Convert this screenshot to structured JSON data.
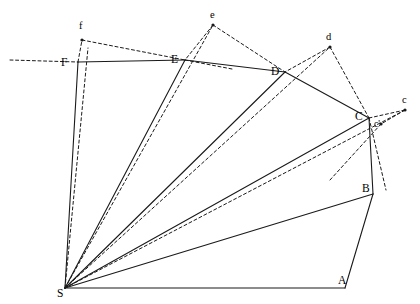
{
  "figure": {
    "width": 420,
    "height": 304,
    "background_color": "#ffffff",
    "stroke_color": "#1a1a1a",
    "solid_stroke_width": 1.1,
    "dashed_stroke_width": 1.0,
    "dash_pattern": "3,2.6",
    "dot_radius": 1.6
  },
  "points": {
    "S": {
      "x": 65,
      "y": 288,
      "label": "S",
      "label_x": 57,
      "label_y": 288,
      "kind": "apex"
    },
    "A": {
      "x": 345,
      "y": 288,
      "label": "A",
      "label_x": 338,
      "label_y": 275,
      "kind": "polygon"
    },
    "B": {
      "x": 373,
      "y": 194,
      "label": "B",
      "label_x": 362,
      "label_y": 183,
      "kind": "polygon"
    },
    "C": {
      "x": 369,
      "y": 118,
      "label": "C",
      "label_x": 355,
      "label_y": 111,
      "kind": "polygon"
    },
    "D": {
      "x": 285,
      "y": 72,
      "label": "D",
      "label_x": 271,
      "label_y": 66,
      "kind": "polygon"
    },
    "E": {
      "x": 185,
      "y": 60,
      "label": "E",
      "label_x": 171,
      "label_y": 54,
      "kind": "polygon"
    },
    "F": {
      "x": 78,
      "y": 62,
      "label": "F",
      "label_x": 61,
      "label_y": 57,
      "kind": "polygon"
    },
    "c": {
      "x": 405,
      "y": 110,
      "label": "c",
      "label_x": 402,
      "label_y": 95,
      "kind": "image"
    },
    "cp": {
      "x": 381,
      "y": 124,
      "label": "c'",
      "label_x": 374,
      "label_y": 120,
      "kind": "image"
    },
    "d": {
      "x": 330,
      "y": 47,
      "label": "d",
      "label_x": 326,
      "label_y": 32,
      "kind": "image"
    },
    "e": {
      "x": 213,
      "y": 25,
      "label": "e",
      "label_x": 210,
      "label_y": 10,
      "kind": "image"
    },
    "f": {
      "x": 82,
      "y": 40,
      "label": "f",
      "label_x": 79,
      "label_y": 21,
      "kind": "image"
    }
  },
  "solid_edges": [
    {
      "name": "edge-S-A",
      "from": "S",
      "to": "A"
    },
    {
      "name": "edge-A-B",
      "from": "A",
      "to": "B"
    },
    {
      "name": "edge-B-C",
      "from": "B",
      "to": "C"
    },
    {
      "name": "edge-C-D",
      "from": "C",
      "to": "D"
    },
    {
      "name": "edge-D-E",
      "from": "D",
      "to": "E"
    },
    {
      "name": "edge-E-F",
      "from": "E",
      "to": "F"
    },
    {
      "name": "edge-F-S",
      "from": "F",
      "to": "S"
    },
    {
      "name": "ray-S-B",
      "from": "S",
      "to": "B"
    },
    {
      "name": "ray-S-C",
      "from": "S",
      "to": "C"
    },
    {
      "name": "ray-S-D",
      "from": "S",
      "to": "D"
    },
    {
      "name": "ray-S-E",
      "from": "S",
      "to": "E"
    }
  ],
  "dashed_edges": [
    {
      "name": "dashed-extension-left",
      "x1": 10,
      "y1": 60,
      "x2": 78,
      "y2": 62
    },
    {
      "name": "dashed-F-f",
      "x1": 78,
      "y1": 62,
      "x2": 82,
      "y2": 40
    },
    {
      "name": "dashed-f-E",
      "x1": 82,
      "y1": 40,
      "x2": 185,
      "y2": 60
    },
    {
      "name": "dashed-E-ext-right",
      "x1": 185,
      "y1": 60,
      "x2": 232,
      "y2": 69
    },
    {
      "name": "dashed-S-f",
      "x1": 65,
      "y1": 288,
      "x2": 88,
      "y2": 48
    },
    {
      "name": "dashed-S-e",
      "x1": 65,
      "y1": 288,
      "x2": 213,
      "y2": 25
    },
    {
      "name": "dashed-e-E",
      "x1": 213,
      "y1": 25,
      "x2": 185,
      "y2": 60
    },
    {
      "name": "dashed-e-D",
      "x1": 213,
      "y1": 25,
      "x2": 285,
      "y2": 72
    },
    {
      "name": "dashed-S-d",
      "x1": 65,
      "y1": 288,
      "x2": 330,
      "y2": 47
    },
    {
      "name": "dashed-d-D",
      "x1": 330,
      "y1": 47,
      "x2": 285,
      "y2": 72
    },
    {
      "name": "dashed-d-C",
      "x1": 330,
      "y1": 47,
      "x2": 369,
      "y2": 118
    },
    {
      "name": "dashed-S-c",
      "x1": 65,
      "y1": 288,
      "x2": 405,
      "y2": 110
    },
    {
      "name": "dashed-C-c",
      "x1": 369,
      "y1": 118,
      "x2": 405,
      "y2": 110
    },
    {
      "name": "dashed-c-cp",
      "x1": 405,
      "y1": 110,
      "x2": 381,
      "y2": 124
    },
    {
      "name": "dashed-C-B-offset",
      "x1": 369,
      "y1": 118,
      "x2": 386,
      "y2": 190
    },
    {
      "name": "dashed-cp-down",
      "x1": 381,
      "y1": 124,
      "x2": 330,
      "y2": 180
    }
  ],
  "dots": [
    "c",
    "d",
    "e",
    "f",
    "cp"
  ]
}
